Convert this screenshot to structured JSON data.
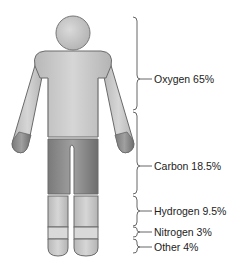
{
  "diagram": {
    "elements": [
      {
        "name": "Oxygen",
        "percent": "65%",
        "label": "Oxygen 65%"
      },
      {
        "name": "Carbon",
        "percent": "18.5%",
        "label": "Carbon 18.5%"
      },
      {
        "name": "Hydrogen",
        "percent": "9.5%",
        "label": "Hydrogen 9.5%"
      },
      {
        "name": "Nitrogen",
        "percent": "3%",
        "label": "Nitrogen 3%"
      },
      {
        "name": "Other",
        "percent": "4%",
        "label": "Other 4%"
      }
    ],
    "colors": {
      "oxygen": "#c4c4c4",
      "carbon": "#8c8c8c",
      "hydrogen": "#c9c9c9",
      "nitrogen": "#d8d8d8",
      "other": "#cdcdcd",
      "outline": "#6a6a6a",
      "brace": "#555555"
    }
  }
}
